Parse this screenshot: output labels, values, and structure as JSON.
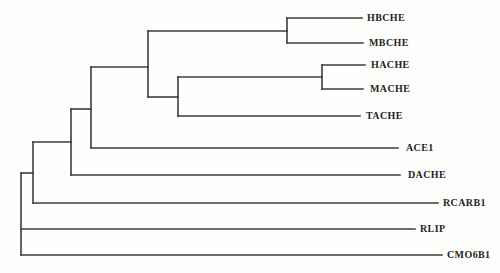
{
  "figure": {
    "type": "phylogenetic-tree",
    "background_color": "#fdfdfc",
    "line_color": "#3d3d3d",
    "text_color": "#242424"
  },
  "tree": {
    "newick": "(((((((HBCHE,MBCHE),((HACHE,MACHE),TACHE)),ACE1),DACHE),RCARB1),RLIP),CMO6B1);",
    "leaves": [
      {
        "label": "HBCHE",
        "tip_x": 362,
        "y": 18,
        "label_x": 367
      },
      {
        "label": "MBCHE",
        "tip_x": 363,
        "y": 43,
        "label_x": 369
      },
      {
        "label": "HACHE",
        "tip_x": 365,
        "y": 65,
        "label_x": 371
      },
      {
        "label": "MACHE",
        "tip_x": 363,
        "y": 89,
        "label_x": 370
      },
      {
        "label": "TACHE",
        "tip_x": 360,
        "y": 116,
        "label_x": 366
      },
      {
        "label": "ACE1",
        "tip_x": 398,
        "y": 148,
        "label_x": 406
      },
      {
        "label": "DACHE",
        "tip_x": 400,
        "y": 175,
        "label_x": 408
      },
      {
        "label": "RCARB1",
        "tip_x": 438,
        "y": 203,
        "label_x": 443
      },
      {
        "label": "RLIP",
        "tip_x": 415,
        "y": 229,
        "label_x": 420
      },
      {
        "label": "CMO6B1",
        "tip_x": 442,
        "y": 255,
        "label_x": 447
      }
    ],
    "segments": [
      {
        "name": "branch-hbche",
        "x1": 287,
        "y1": 18,
        "x2": 362,
        "y2": 18
      },
      {
        "name": "branch-mbche",
        "x1": 287,
        "y1": 43,
        "x2": 363,
        "y2": 43
      },
      {
        "name": "branch-hache",
        "x1": 322,
        "y1": 65,
        "x2": 365,
        "y2": 65
      },
      {
        "name": "branch-mache",
        "x1": 322,
        "y1": 89,
        "x2": 363,
        "y2": 89
      },
      {
        "name": "branch-tache",
        "x1": 178,
        "y1": 116,
        "x2": 360,
        "y2": 116
      },
      {
        "name": "branch-ace1",
        "x1": 91,
        "y1": 148,
        "x2": 398,
        "y2": 148
      },
      {
        "name": "branch-dache",
        "x1": 71,
        "y1": 175,
        "x2": 400,
        "y2": 175
      },
      {
        "name": "branch-rcarb1",
        "x1": 33,
        "y1": 203,
        "x2": 438,
        "y2": 203
      },
      {
        "name": "branch-rlip",
        "x1": 21,
        "y1": 229,
        "x2": 415,
        "y2": 229
      },
      {
        "name": "branch-cmo6b1",
        "x1": 21,
        "y1": 255,
        "x2": 442,
        "y2": 255
      },
      {
        "name": "stem-hbche-mbche",
        "x1": 148,
        "y1": 31,
        "x2": 287,
        "y2": 31
      },
      {
        "name": "stem-hache-mache",
        "x1": 178,
        "y1": 77,
        "x2": 322,
        "y2": 77
      },
      {
        "name": "stem-ache-tache",
        "x1": 148,
        "y1": 97,
        "x2": 178,
        "y2": 97
      },
      {
        "name": "stem-che-clade",
        "x1": 91,
        "y1": 67,
        "x2": 148,
        "y2": 67
      },
      {
        "name": "stem-ace1-clade",
        "x1": 71,
        "y1": 109,
        "x2": 91,
        "y2": 109
      },
      {
        "name": "stem-dache-clade",
        "x1": 33,
        "y1": 142,
        "x2": 71,
        "y2": 142
      },
      {
        "name": "stem-rcarb1-clade",
        "x1": 21,
        "y1": 173,
        "x2": 33,
        "y2": 173
      },
      {
        "name": "node-hbche-mbche",
        "x1": 287,
        "y1": 18,
        "x2": 287,
        "y2": 43
      },
      {
        "name": "node-hache-mache",
        "x1": 322,
        "y1": 65,
        "x2": 322,
        "y2": 89
      },
      {
        "name": "node-ache-tache",
        "x1": 178,
        "y1": 77,
        "x2": 178,
        "y2": 116
      },
      {
        "name": "node-che-clade",
        "x1": 148,
        "y1": 31,
        "x2": 148,
        "y2": 97
      },
      {
        "name": "node-ace1",
        "x1": 91,
        "y1": 67,
        "x2": 91,
        "y2": 148
      },
      {
        "name": "node-dache",
        "x1": 71,
        "y1": 109,
        "x2": 71,
        "y2": 175
      },
      {
        "name": "node-rcarb1",
        "x1": 33,
        "y1": 142,
        "x2": 33,
        "y2": 203
      },
      {
        "name": "node-root",
        "x1": 21,
        "y1": 173,
        "x2": 21,
        "y2": 255
      }
    ]
  }
}
